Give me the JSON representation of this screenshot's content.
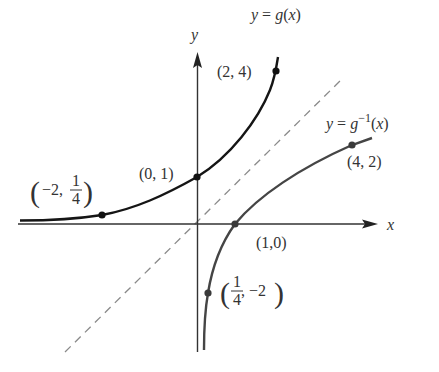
{
  "figure": {
    "axes": {
      "x_label": "x",
      "y_label": "y"
    },
    "curves": {
      "g": {
        "label_prefix": "y = ",
        "label_func": "g",
        "label_arg": "(x)",
        "color": "#1a1a1a"
      },
      "g_inverse": {
        "label_prefix": "y = ",
        "label_func": "g",
        "label_sup": "−1",
        "label_arg": "(x)",
        "color": "#444444"
      },
      "identity": {
        "style": "dashed",
        "color": "#888888"
      }
    },
    "points": {
      "g_neg2": {
        "label_open": "(",
        "label_x": "−2,",
        "label_num": "1",
        "label_den": "4",
        "label_close": ")"
      },
      "g_0": {
        "label": "(0, 1)"
      },
      "g_2": {
        "label": "(2, 4)"
      },
      "ginv_quarter": {
        "label_open": "(",
        "label_num": "1",
        "label_den": "4",
        "label_y": ", −2",
        "label_close": ")"
      },
      "ginv_1": {
        "label": "(1,0)"
      },
      "ginv_4": {
        "label": "(4, 2)"
      }
    }
  }
}
